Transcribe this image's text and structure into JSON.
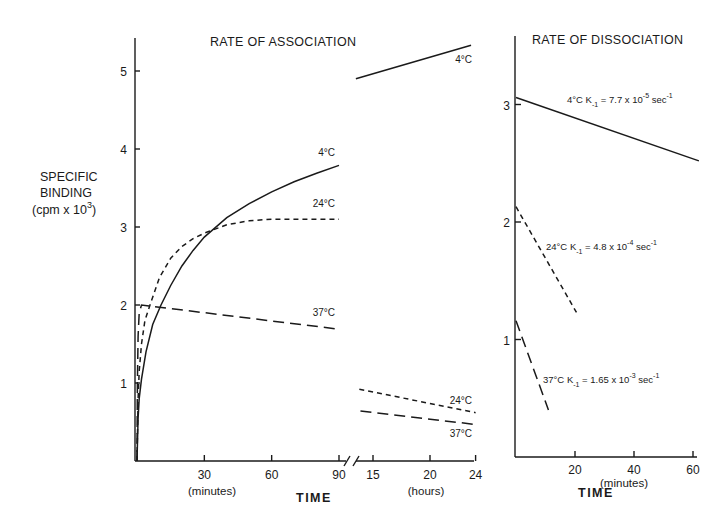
{
  "chart_data": [
    {
      "type": "line",
      "panel": "association-minutes",
      "title": "RATE OF ASSOCIATION",
      "ylabel": [
        "SPECIFIC",
        "BINDING",
        "(cpm x 10",
        "3",
        ")"
      ],
      "xlabel": "(minutes)",
      "shared_xlabel": "TIME",
      "xlim": [
        0,
        90
      ],
      "ylim": [
        0,
        5.4
      ],
      "xticks": [
        30,
        60,
        90
      ],
      "yticks": [
        1,
        2,
        3,
        4,
        5
      ],
      "grid": false,
      "series": [
        {
          "name": "4°C",
          "style": "solid",
          "x": [
            0,
            0.5,
            1,
            2,
            4,
            7,
            10.7,
            15,
            20,
            25,
            30,
            40,
            50,
            60,
            70,
            80,
            90
          ],
          "y": [
            0,
            0.55,
            0.8,
            1.05,
            1.4,
            1.75,
            2.0,
            2.25,
            2.5,
            2.7,
            2.87,
            3.12,
            3.3,
            3.45,
            3.58,
            3.69,
            3.79
          ]
        },
        {
          "name": "24°C",
          "style": "short-dash",
          "x": [
            0,
            0.5,
            1,
            2,
            3.5,
            5.8,
            10,
            15,
            20,
            25,
            30,
            40,
            50,
            60,
            70,
            80,
            90
          ],
          "y": [
            0,
            0.8,
            1.15,
            1.5,
            1.8,
            2.0,
            2.35,
            2.6,
            2.75,
            2.85,
            2.92,
            3.03,
            3.08,
            3.1,
            3.1,
            3.1,
            3.1
          ]
        },
        {
          "name": "37°C",
          "style": "long-dash",
          "x": [
            0,
            0.2,
            0.5,
            1,
            2,
            90
          ],
          "y": [
            0,
            1.0,
            1.6,
            1.9,
            2.0,
            1.69
          ]
        }
      ],
      "annotations": [
        "4°C",
        "24°C",
        "37°C"
      ]
    },
    {
      "type": "line",
      "panel": "association-hours",
      "xlabel": "(hours)",
      "xlim": [
        13,
        24
      ],
      "ylim": [
        0,
        5.4
      ],
      "xticks": [
        15,
        20,
        24
      ],
      "axis_break": true,
      "series": [
        {
          "name": "4°C",
          "style": "solid",
          "x": [
            13.5,
            23.6
          ],
          "y": [
            4.9,
            5.33
          ]
        },
        {
          "name": "24°C",
          "style": "short-dash",
          "x": [
            13.8,
            24
          ],
          "y": [
            0.92,
            0.62
          ]
        },
        {
          "name": "37°C",
          "style": "long-dash",
          "x": [
            13.9,
            23.9
          ],
          "y": [
            0.64,
            0.47
          ]
        }
      ],
      "annotations": [
        "4°C",
        "24°C",
        "37°C"
      ]
    },
    {
      "type": "line",
      "panel": "dissociation",
      "title": "RATE OF DISSOCIATION",
      "xlabel": "(minutes)",
      "shared_xlabel": "TIME",
      "xlim": [
        0,
        62
      ],
      "ylim": [
        0,
        3.4
      ],
      "xticks": [
        20,
        40,
        60
      ],
      "yticks": [
        1,
        2,
        3
      ],
      "grid": false,
      "series": [
        {
          "name": "4°C",
          "style": "solid",
          "x": [
            0,
            62
          ],
          "y": [
            3.06,
            2.52
          ],
          "label": {
            "temp": "4°C",
            "k": "K",
            "ksub": "-1",
            "eq": " = 7.7 x 10",
            "exp": "-5",
            "unit": " sec",
            "unitexp": "-1"
          }
        },
        {
          "name": "24°C",
          "style": "short-dash",
          "x": [
            0,
            20.5
          ],
          "y": [
            2.13,
            1.23
          ],
          "label": {
            "temp": "24°C",
            "k": "K",
            "ksub": "-1",
            "eq": " = 4.8 x 10",
            "exp": "-4",
            "unit": " sec",
            "unitexp": "-1"
          }
        },
        {
          "name": "37°C",
          "style": "long-dash",
          "x": [
            0,
            11
          ],
          "y": [
            1.16,
            0.4
          ],
          "label": {
            "temp": "37°C",
            "k": "K",
            "ksub": "-1",
            "eq": " = 1.65 x 10",
            "exp": "-3",
            "unit": " sec",
            "unitexp": "-1"
          }
        }
      ]
    }
  ]
}
